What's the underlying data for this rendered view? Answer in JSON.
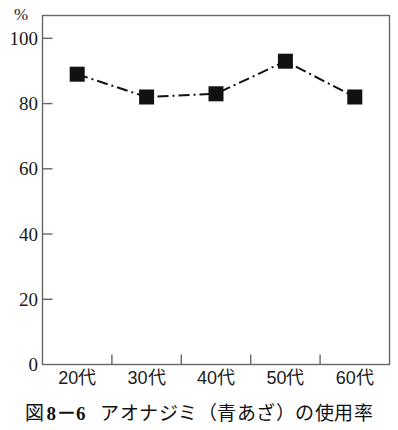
{
  "chart_data": {
    "type": "line",
    "title": "",
    "categories": [
      "20代",
      "30代",
      "40代",
      "50代",
      "60代"
    ],
    "values": [
      89,
      82,
      83,
      93,
      82
    ],
    "series": [
      {
        "name": "アオナジミ（青あざ）の使用率",
        "values": [
          89,
          82,
          83,
          93,
          82
        ]
      }
    ],
    "xlabel": "",
    "ylabel": "%",
    "ylim": [
      0,
      107
    ],
    "yticks": [
      0,
      20,
      40,
      60,
      80,
      100
    ],
    "ytick_labels": [
      "0",
      "20",
      "40",
      "60",
      "80",
      "100"
    ],
    "grid": false,
    "legend": false,
    "line_style": "dash-dot",
    "marker": "square",
    "marker_color": "#111111",
    "line_color": "#111111",
    "frame": true
  },
  "axis": {
    "unit_label": "%",
    "ytick_labels": [
      "100",
      "80",
      "60",
      "40",
      "20",
      "0"
    ],
    "xtick_labels": [
      "20代",
      "30代",
      "40代",
      "50代",
      "60代"
    ]
  },
  "caption": {
    "prefix": "図",
    "number": "8－6",
    "text": "アオナジミ（青あざ）の使用率"
  },
  "colors": {
    "ink": "#111111",
    "frame": "#555555",
    "background": "#ffffff"
  }
}
